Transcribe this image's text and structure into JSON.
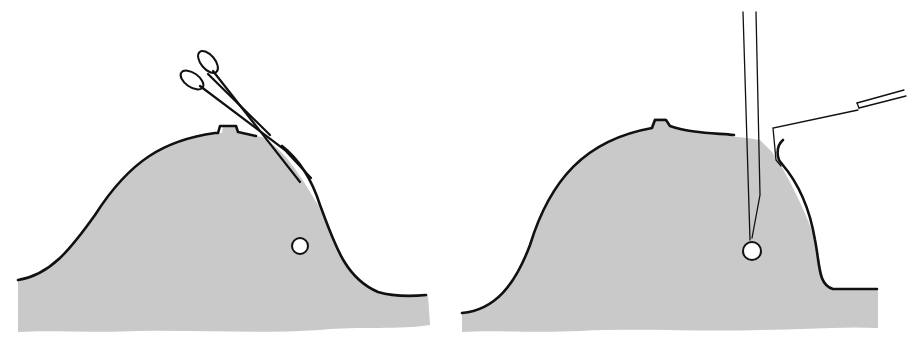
{
  "figure": {
    "panels": [
      {
        "id": "left",
        "description": "Breast cross-section with forceps inserted near nipple; lesion shown as small circle",
        "colors": {
          "tissue": "#c9c9c9",
          "outline": "#111111"
        },
        "lesion": {
          "cx": 300,
          "cy": 246,
          "r": 8
        },
        "instrument": "forceps"
      },
      {
        "id": "right",
        "description": "Breast cross-section with needle inserted vertically to lesion and retractor hook lifting skin flap",
        "colors": {
          "tissue": "#c9c9c9",
          "outline": "#111111"
        },
        "lesion": {
          "cx": 752,
          "cy": 251,
          "r": 9
        },
        "instrument": "needle-and-hook"
      }
    ]
  }
}
